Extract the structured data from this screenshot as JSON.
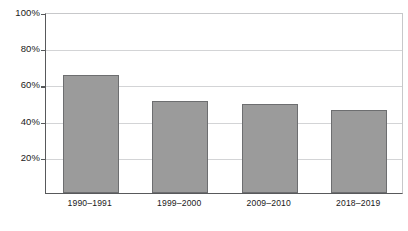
{
  "chart_data": {
    "type": "bar",
    "title": "",
    "subtitle": "",
    "xlabel": "",
    "ylabel": "",
    "categories": [
      "1990–1991",
      "1999–2000",
      "2009–2010",
      "2018–2019"
    ],
    "values": [
      65,
      51,
      49,
      46
    ],
    "value_labels": [
      "65%",
      "51%",
      "49%",
      "46%"
    ],
    "ylim": [
      0,
      100
    ],
    "yticks": [
      20,
      40,
      60,
      80,
      100
    ],
    "ytick_labels": [
      "20%",
      "40%",
      "60%",
      "80%",
      "100%"
    ],
    "grid": true,
    "grid_axis": "y",
    "legend": false,
    "legend_position": "none",
    "series": [
      {
        "name": "",
        "values": [
          65,
          51,
          49,
          46
        ]
      }
    ],
    "colors": {
      "bar_fill": "#9b9b9b",
      "bar_edge": "#6d6e70",
      "axis": "#58595b",
      "gridline": "#d3d4d6",
      "background": "#ffffff",
      "text": "#1a1a1a"
    }
  },
  "axis": {
    "y_ticks": [
      {
        "label": "100%",
        "value": 100
      },
      {
        "label": "80%",
        "value": 80
      },
      {
        "label": "60%",
        "value": 60
      },
      {
        "label": "40%",
        "value": 40
      },
      {
        "label": "20%",
        "value": 20
      }
    ],
    "x_ticks": [
      {
        "label": "1990–1991"
      },
      {
        "label": "1999–2000"
      },
      {
        "label": "2009–2010"
      },
      {
        "label": "2018–2019"
      }
    ]
  }
}
